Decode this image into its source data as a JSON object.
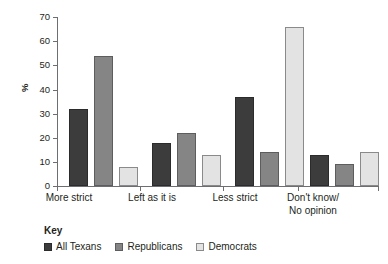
{
  "chart_data": {
    "type": "bar",
    "title": "",
    "xlabel": "",
    "ylabel": "%",
    "ylim": [
      0,
      70
    ],
    "yticks": [
      0,
      10,
      20,
      30,
      40,
      50,
      60,
      70
    ],
    "grid": false,
    "legend_position": "bottom-left",
    "legend_title": "Key",
    "categories": [
      "More strict",
      "Left as it is",
      "Less strict",
      "Don't know/\nNo opinion"
    ],
    "series": [
      {
        "name": "All Texans",
        "color": "#3c3c3c",
        "values": [
          32,
          18,
          37,
          13
        ]
      },
      {
        "name": "Republicans",
        "color": "#858585",
        "values": [
          54,
          22,
          14,
          9
        ]
      },
      {
        "name": "Democrats",
        "color": "#e3e3e3",
        "values": [
          8,
          13,
          66,
          14
        ]
      }
    ]
  },
  "axis": {
    "y_label": "%",
    "tick_labels": [
      "70",
      "60",
      "50",
      "40",
      "30",
      "20",
      "10",
      "0"
    ]
  },
  "category_labels": [
    {
      "line1": "More strict",
      "line2": ""
    },
    {
      "line1": "Left as it is",
      "line2": ""
    },
    {
      "line1": "Less strict",
      "line2": ""
    },
    {
      "line1": "Don't know/",
      "line2": "No opinion"
    }
  ],
  "key": {
    "title": "Key",
    "items": [
      {
        "label": "All Texans"
      },
      {
        "label": "Republicans"
      },
      {
        "label": "Democrats"
      }
    ]
  }
}
